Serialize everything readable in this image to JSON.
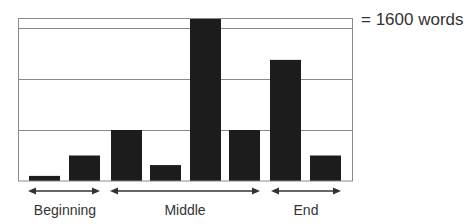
{
  "legend": {
    "text": "= 1600 words"
  },
  "sections": [
    {
      "label": "Beginning",
      "bar_indices": [
        0,
        1
      ]
    },
    {
      "label": "Middle",
      "bar_indices": [
        2,
        3,
        4,
        5
      ]
    },
    {
      "label": "End",
      "bar_indices": [
        6,
        7
      ]
    }
  ],
  "colors": {
    "bar": "#1c1c1c",
    "grid": "#8a8a8a",
    "text": "#333333"
  },
  "chart_data": {
    "type": "bar",
    "title": "",
    "xlabel": "",
    "ylabel": "",
    "unit_note": "Each gridline interval = 1600 words",
    "categories": [
      "Beginning 1",
      "Beginning 2",
      "Middle 1",
      "Middle 2",
      "Middle 3",
      "Middle 4",
      "End 1",
      "End 2"
    ],
    "groups": [
      "Beginning",
      "Beginning",
      "Middle",
      "Middle",
      "Middle",
      "Middle",
      "End",
      "End"
    ],
    "values": [
      160,
      800,
      1600,
      500,
      5100,
      1600,
      3800,
      800
    ],
    "ylim": [
      0,
      5100
    ],
    "gridlines": [
      1600,
      3200,
      4800
    ],
    "grid": true,
    "legend_position": "top-right"
  }
}
